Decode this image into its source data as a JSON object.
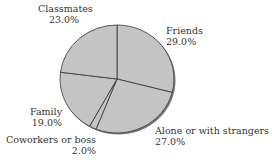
{
  "chart_data": {
    "type": "pie",
    "title": "",
    "start_angle_deg": 0,
    "direction": "clockwise",
    "slices": [
      {
        "label": "Friends",
        "value": 29.0,
        "display": "29.0%"
      },
      {
        "label": "Alone or with strangers",
        "value": 27.0,
        "display": "27.0%"
      },
      {
        "label": "Coworkers or boss",
        "value": 2.0,
        "display": "2.0%"
      },
      {
        "label": "Family",
        "value": 19.0,
        "display": "19.0%"
      },
      {
        "label": "Classmates",
        "value": 23.0,
        "display": "23.0%"
      }
    ],
    "colors": {
      "fill": "#c4c4c4",
      "edge": "#333333",
      "shadow": "#7a7a7a"
    }
  }
}
